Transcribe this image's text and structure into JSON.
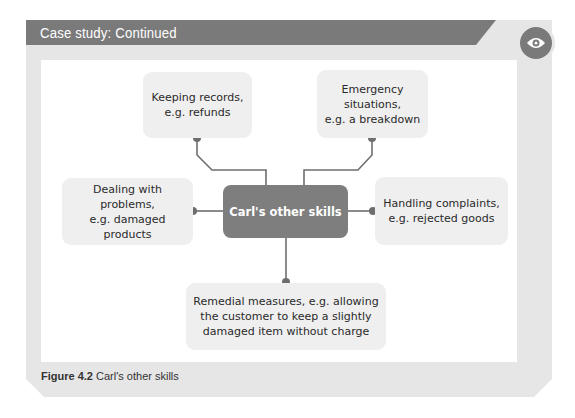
{
  "header": {
    "title": "Case study: Continued",
    "badge_icon": "eye-icon"
  },
  "diagram": {
    "central": {
      "label": "Carl's other skills"
    },
    "nodes": [
      {
        "id": "keeping-records",
        "label": "Keeping records,\ne.g. refunds"
      },
      {
        "id": "emergency",
        "label": "Emergency\nsituations,\ne.g. a breakdown"
      },
      {
        "id": "dealing",
        "label": "Dealing with problems,\ne.g. damaged products"
      },
      {
        "id": "handling",
        "label": "Handling complaints,\ne.g. rejected goods"
      },
      {
        "id": "remedial",
        "label": "Remedial measures, e.g. allowing\nthe customer to keep a slightly\ndamaged item without charge"
      }
    ]
  },
  "caption": {
    "figure": "Figure 4.2",
    "text": "Carl's other skills"
  },
  "colors": {
    "header": "#7a7a7a",
    "frame": "#e6e6e6",
    "node": "#efefef",
    "central": "#7e7e7e",
    "line": "#6e6e6e"
  }
}
